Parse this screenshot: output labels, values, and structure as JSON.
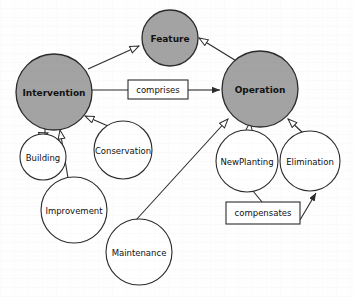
{
  "diagram": {
    "type": "uml-generalization-diagram",
    "colors": {
      "node_fill_primary": "#a3a3a3",
      "node_fill_secondary": "#ffffff",
      "node_stroke": "#2b2b2b",
      "edge_stroke": "#2b2b2b",
      "label_text": "#111111",
      "background": "#fefefe",
      "box_fill": "#ffffff"
    },
    "nodes": [
      {
        "id": "feature",
        "label": "Feature",
        "shape": "circle",
        "style": "filled",
        "cx": 170,
        "cy": 38,
        "r": 28
      },
      {
        "id": "intervention",
        "label": "Intervention",
        "shape": "circle",
        "style": "filled",
        "cx": 54,
        "cy": 92,
        "r": 38
      },
      {
        "id": "operation",
        "label": "Operation",
        "shape": "circle",
        "style": "filled",
        "cx": 260,
        "cy": 89,
        "r": 38
      },
      {
        "id": "building",
        "label": "Building",
        "shape": "circle",
        "style": "outline",
        "cx": 43,
        "cy": 157,
        "r": 23
      },
      {
        "id": "conservation",
        "label": "Conservation",
        "shape": "circle",
        "style": "outline",
        "cx": 123,
        "cy": 150,
        "r": 29
      },
      {
        "id": "improvement",
        "label": "Improvement",
        "shape": "circle",
        "style": "outline",
        "cx": 74,
        "cy": 210,
        "r": 33
      },
      {
        "id": "maintenance",
        "label": "Maintenance",
        "shape": "circle",
        "style": "outline",
        "cx": 139,
        "cy": 252,
        "r": 33
      },
      {
        "id": "newplanting",
        "label": "NewPlanting",
        "shape": "circle",
        "style": "outline",
        "cx": 247,
        "cy": 161,
        "r": 31
      },
      {
        "id": "elimination",
        "label": "Elimination",
        "shape": "circle",
        "style": "outline",
        "cx": 310,
        "cy": 161,
        "r": 30
      }
    ],
    "label_boxes": [
      {
        "id": "comprises",
        "label": "comprises",
        "x": 128,
        "y": 80,
        "w": 60,
        "h": 19
      },
      {
        "id": "compensates",
        "label": "compensates",
        "x": 226,
        "y": 202,
        "w": 74,
        "h": 22
      }
    ],
    "edges": [
      {
        "id": "intervention-to-feature",
        "from": "Intervention",
        "to": "Feature",
        "arrow": "hollow-triangle"
      },
      {
        "id": "operation-to-feature",
        "from": "Operation",
        "to": "Feature",
        "arrow": "hollow-triangle"
      },
      {
        "id": "intervention-comprises-operation",
        "from": "Intervention",
        "to": "Operation",
        "arrow": "solid",
        "label": "comprises"
      },
      {
        "id": "building-to-intervention",
        "from": "Building",
        "to": "Intervention",
        "arrow": "hollow-triangle"
      },
      {
        "id": "improvement-to-intervention",
        "from": "Improvement",
        "to": "Intervention",
        "arrow": "hollow-triangle"
      },
      {
        "id": "conservation-to-intervention",
        "from": "Conservation",
        "to": "Intervention",
        "arrow": "hollow-triangle"
      },
      {
        "id": "maintenance-to-operation",
        "from": "Maintenance",
        "to": "Operation",
        "arrow": "hollow-triangle"
      },
      {
        "id": "newplanting-to-operation",
        "from": "NewPlanting",
        "to": "Operation",
        "arrow": "hollow-triangle"
      },
      {
        "id": "elimination-to-operation",
        "from": "Elimination",
        "to": "Operation",
        "arrow": "hollow-triangle"
      },
      {
        "id": "newplanting-compensates-elimination",
        "from": "NewPlanting",
        "to": "Elimination",
        "arrow": "solid",
        "label": "compensates"
      }
    ]
  }
}
